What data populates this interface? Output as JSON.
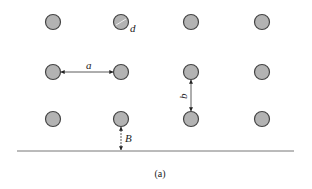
{
  "diagram": {
    "type": "tube-bank-layout",
    "caption": "(a)",
    "colors": {
      "tube_fill": "#b3b3b3",
      "tube_stroke": "#444444",
      "line": "#555555"
    },
    "grid": {
      "columns_x": [
        53,
        121,
        191,
        262
      ],
      "rows_y": [
        22,
        72,
        119
      ],
      "radius": 7.5
    },
    "labels": {
      "diameter": "d",
      "horizontal_pitch": "a",
      "vertical_pitch": "b",
      "wall_gap": "B"
    },
    "wall": {
      "x1": 17,
      "x2": 294,
      "y": 151
    }
  }
}
